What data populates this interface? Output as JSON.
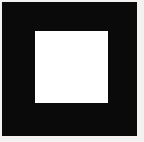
{
  "image": {
    "width": 144,
    "height": 142,
    "background_color": "#f3f2f0",
    "description": "Solid black square with a centered square hole knocked out, rendered on a near-white background."
  },
  "shapes": {
    "outer_square": {
      "name": "outer-square",
      "fill_color": "#0a0a0a",
      "x": 2,
      "y": 2,
      "width": 135,
      "height": 134
    },
    "inner_square": {
      "name": "inner-square",
      "fill_color": "#ffffff",
      "x": 35,
      "y": 31,
      "width": 73,
      "height": 72
    }
  },
  "labels": {
    "caption": ""
  }
}
